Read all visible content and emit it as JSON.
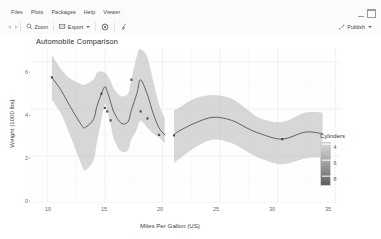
{
  "window": {
    "minimize_icon": "window-minimize-icon",
    "maximize_icon": "window-maximize-icon"
  },
  "menubar": {
    "items": [
      {
        "label": "Files"
      },
      {
        "label": "Plots"
      },
      {
        "label": "Packages"
      },
      {
        "label": "Help"
      },
      {
        "label": "Viewer"
      }
    ]
  },
  "toolbar": {
    "back_icon": "arrow-left-icon",
    "forward_icon": "arrow-right-icon",
    "zoom_label": "Zoom",
    "zoom_icon": "magnifier-icon",
    "export_label": "Export",
    "export_icon": "export-image-icon",
    "export_caret": "chevron-down-icon",
    "remove_icon": "remove-plot-icon",
    "clear_icon": "broom-clear-icon",
    "publish_label": "Publish",
    "publish_icon": "publish-icon",
    "publish_caret": "chevron-down-icon"
  },
  "chart_data": {
    "type": "line",
    "title": "Automobile Comparison",
    "xlabel": "Miles Per Gallon (US)",
    "ylabel": "Weight (1000 lbs)",
    "xlim": [
      8.5,
      35.5
    ],
    "ylim": [
      0,
      6.6
    ],
    "xticks": [
      10,
      15,
      20,
      25,
      30,
      35
    ],
    "yticks": [
      0,
      2,
      4,
      6
    ],
    "grid": true,
    "legend": {
      "title": "Cylinders",
      "type": "colorbar",
      "position": "right",
      "ticks": [
        4,
        6,
        8
      ],
      "gradient_low": "#d8d8d8",
      "gradient_high": "#5d5d5d"
    },
    "ribbon_color": "#bfbfbf",
    "line_color": "#4d4d4d",
    "point_color": "#3a3a3a",
    "series": [
      {
        "name": "loess smooth (segment 1)",
        "x": [
          10.4,
          11.2,
          12.0,
          13.0,
          13.3,
          14.0,
          14.3,
          14.7,
          15.0,
          15.2,
          15.5,
          15.8,
          16.4,
          17.0,
          17.3,
          17.8,
          18.1,
          18.7,
          19.2,
          19.7,
          20.2
        ],
        "y": [
          5.35,
          4.8,
          4.1,
          3.3,
          3.22,
          3.55,
          4.1,
          4.65,
          4.95,
          4.75,
          4.3,
          3.85,
          3.4,
          3.45,
          3.95,
          4.7,
          5.25,
          4.6,
          3.8,
          3.2,
          2.9
        ]
      },
      {
        "name": "loess smooth (segment 2)",
        "x": [
          21.0,
          21.4,
          22.8,
          24.4,
          26.0,
          27.3,
          28.5,
          30.4,
          32.4,
          33.9
        ],
        "y": [
          2.9,
          3.05,
          3.4,
          3.65,
          3.52,
          3.2,
          2.95,
          2.72,
          3.02,
          2.95
        ]
      }
    ],
    "points": [
      {
        "x": 10.4,
        "y": 5.35
      },
      {
        "x": 14.7,
        "y": 4.65
      },
      {
        "x": 15.0,
        "y": 4.05
      },
      {
        "x": 15.2,
        "y": 3.9
      },
      {
        "x": 15.5,
        "y": 3.52
      },
      {
        "x": 17.3,
        "y": 5.25
      },
      {
        "x": 18.1,
        "y": 3.9
      },
      {
        "x": 18.7,
        "y": 3.6
      },
      {
        "x": 19.7,
        "y": 2.9
      },
      {
        "x": 21.0,
        "y": 2.88
      },
      {
        "x": 30.4,
        "y": 2.72
      }
    ],
    "ribbon_upper_1": [
      6.3,
      5.7,
      5.3,
      5.05,
      5.05,
      5.25,
      5.55,
      5.6,
      5.55,
      5.45,
      5.2,
      4.85,
      4.55,
      4.65,
      5.25,
      6.3,
      6.55,
      6.2,
      5.2,
      4.2,
      3.6
    ],
    "ribbon_lower_1": [
      4.4,
      3.8,
      2.85,
      1.6,
      1.4,
      1.8,
      2.55,
      3.55,
      4.25,
      3.95,
      3.35,
      2.7,
      2.2,
      2.25,
      2.7,
      3.15,
      3.5,
      3.2,
      2.95,
      2.8,
      2.55
    ],
    "ribbon_upper_2": [
      3.95,
      4.05,
      4.45,
      4.6,
      4.45,
      4.0,
      3.6,
      3.45,
      3.85,
      3.85
    ],
    "ribbon_lower_2": [
      1.7,
      1.85,
      2.35,
      2.7,
      2.55,
      2.2,
      1.9,
      1.65,
      1.9,
      1.95
    ]
  }
}
